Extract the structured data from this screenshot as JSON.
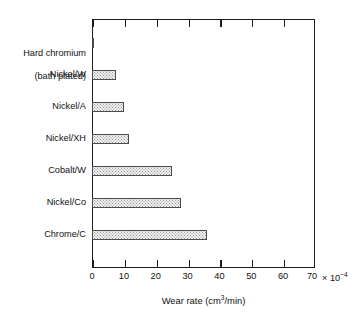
{
  "chart_data": {
    "type": "bar",
    "orientation": "horizontal",
    "title": "",
    "xlabel": "Wear rate (cm3/min)",
    "ylabel": "",
    "xlim": [
      0,
      70
    ],
    "xticks": [
      0,
      10,
      20,
      30,
      40,
      50,
      60,
      70
    ],
    "xtick_labels": [
      "0",
      "10",
      "20",
      "30",
      "40",
      "50",
      "60",
      "70"
    ],
    "x_multiplier": "× 10",
    "x_multiplier_exponent": "-4",
    "x_units": "cm3/min",
    "grid": false,
    "legend": false,
    "categories": [
      "Hard chromium\n(bath plated)",
      "Nickel/W",
      "Nickel/A",
      "Nickel/XH",
      "Cobalt/W",
      "Nickel/Co",
      "Chrome/C"
    ],
    "values": [
      0.7,
      7.5,
      10.0,
      11.5,
      25.0,
      28.0,
      36.0
    ],
    "bar_fill_color": "#eeeeee",
    "bar_edge_color": "#4a4a4a",
    "frame_color": "#1d1d1d",
    "background_color": "#ffffff"
  },
  "axis": {
    "x_title_main": "Wear rate (cm",
    "x_title_sup": "3",
    "x_title_tail": "/min)"
  },
  "labels": {
    "cat0_line1": "Hard chromium",
    "cat0_line2": "(bath plated)",
    "cat1": "Nickel/W",
    "cat2": "Nickel/A",
    "cat3": "Nickel/XH",
    "cat4": "Cobalt/W",
    "cat5": "Nickel/Co",
    "cat6": "Chrome/C"
  }
}
